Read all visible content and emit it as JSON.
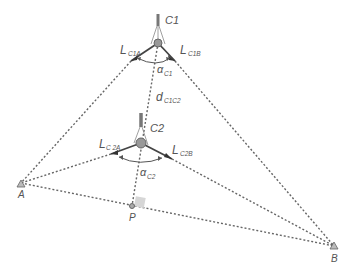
{
  "diagram": {
    "colors": {
      "dotted_line": "#666666",
      "solid_line": "#444444",
      "label": "#555555",
      "instrument": "#888888",
      "right_angle": "#cccccc"
    },
    "points": {
      "A": {
        "label": "A"
      },
      "B": {
        "label": "B"
      },
      "P": {
        "label": "P"
      },
      "C1": {
        "label": "C1"
      },
      "C2": {
        "label": "C2"
      }
    },
    "labels": {
      "L_C1A": {
        "main": "L",
        "sub": "C1A"
      },
      "L_C1B": {
        "main": "L",
        "sub": "C1B"
      },
      "L_C2A": {
        "main": "L",
        "sub": "C 2A"
      },
      "L_C2B": {
        "main": "L",
        "sub": "C2B"
      },
      "alpha_C1": {
        "main": "α",
        "sub": "C1"
      },
      "alpha_C2": {
        "main": "α",
        "sub": "C2"
      },
      "d_C1C2": {
        "main": "d",
        "sub": "C1C2"
      }
    }
  }
}
